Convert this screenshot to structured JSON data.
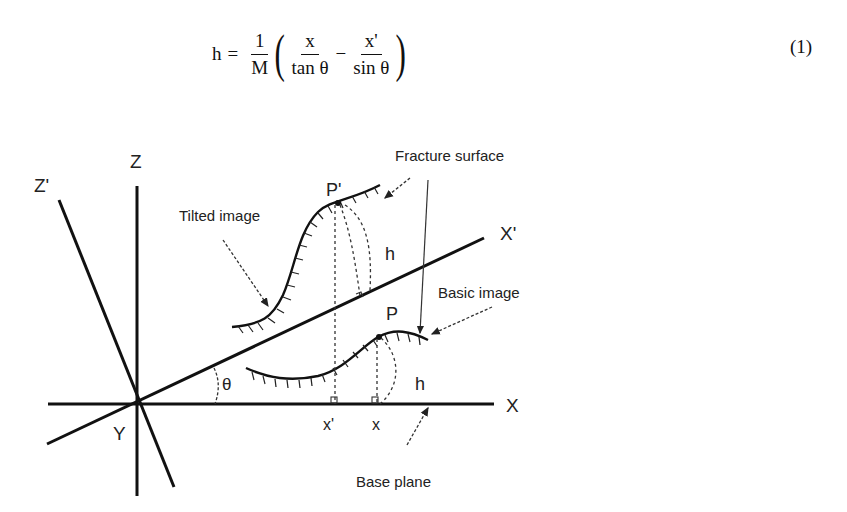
{
  "equation": {
    "lhs": "h",
    "equals": "=",
    "coef_num": "1",
    "coef_den": "M",
    "term1_num": "x",
    "term1_den": "tan θ",
    "minus": "−",
    "term2_num": "x'",
    "term2_den": "sin θ",
    "paren_open": "(",
    "paren_close": ")",
    "number": "(1)"
  },
  "figure": {
    "axes": {
      "z": "Z",
      "z_prime": "Z'",
      "x": "X",
      "x_prime": "X'",
      "y": "Y",
      "angle": "θ"
    },
    "labels": {
      "fracture_surface": "Fracture surface",
      "tilted_image": "Tilted image",
      "basic_image": "Basic image",
      "base_plane": "Base plane",
      "p_prime": "P'",
      "p": "P",
      "h_tilted": "h",
      "h_basic": "h",
      "x_prime_tick": "x'",
      "x_tick": "x"
    }
  }
}
